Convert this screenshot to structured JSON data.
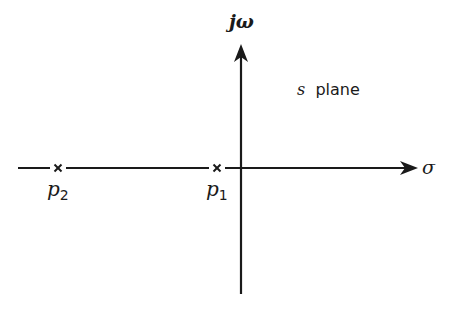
{
  "diagram": {
    "plane_label_var": "s",
    "plane_label_word": "plane",
    "vertical_axis_label": "jω",
    "horizontal_axis_label": "σ",
    "poles": [
      {
        "symbol": "×",
        "name": "p",
        "subscript": "2"
      },
      {
        "symbol": "×",
        "name": "p",
        "subscript": "1"
      }
    ],
    "colors": {
      "ink": "#1a1a1a",
      "background": "#ffffff"
    }
  }
}
